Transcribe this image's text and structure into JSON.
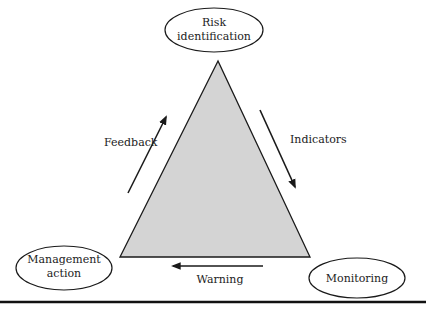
{
  "diagram": {
    "type": "cycle-triangle",
    "nodes": {
      "top": {
        "line1": "Risk",
        "line2": "identification"
      },
      "bottom_left": {
        "line1": "Management",
        "line2": "action"
      },
      "bottom_right": {
        "line1": "Monitoring"
      }
    },
    "edges": {
      "left": {
        "label": "Feedback",
        "direction": "up"
      },
      "right": {
        "label": "Indicators",
        "direction": "down"
      },
      "bottom": {
        "label": "Warning",
        "direction": "left"
      }
    },
    "colors": {
      "triangle_fill": "#d4d4d4",
      "stroke": "#1a1a1a",
      "background": "#ffffff"
    }
  }
}
